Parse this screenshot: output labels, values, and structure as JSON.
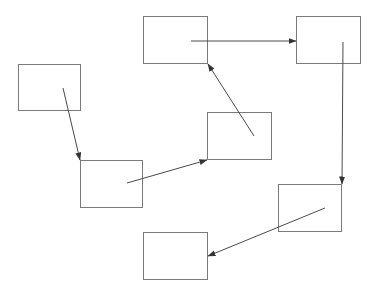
{
  "diagram": {
    "type": "flow",
    "stroke_color": "#7a7a7a",
    "edge_color": "#4a4a4a",
    "background": "#ffffff",
    "nodes": [
      {
        "id": "n1",
        "label": "",
        "x": 18,
        "y": 64,
        "w": 63,
        "h": 47
      },
      {
        "id": "n2",
        "label": "",
        "x": 143,
        "y": 16,
        "w": 65,
        "h": 48
      },
      {
        "id": "n3",
        "label": "",
        "x": 296,
        "y": 16,
        "w": 65,
        "h": 48
      },
      {
        "id": "n4",
        "label": "",
        "x": 207,
        "y": 112,
        "w": 65,
        "h": 48
      },
      {
        "id": "n5",
        "label": "",
        "x": 80,
        "y": 160,
        "w": 63,
        "h": 48
      },
      {
        "id": "n6",
        "label": "",
        "x": 278,
        "y": 184,
        "w": 64,
        "h": 48
      },
      {
        "id": "n7",
        "label": "",
        "x": 143,
        "y": 232,
        "w": 65,
        "h": 48
      }
    ],
    "edges": [
      {
        "from": "n1",
        "to": "n5",
        "x1": 63,
        "y1": 88,
        "x2": 80,
        "y2": 160
      },
      {
        "from": "n5",
        "to": "n4",
        "x1": 127,
        "y1": 183,
        "x2": 207,
        "y2": 160
      },
      {
        "from": "n4",
        "to": "n2",
        "x1": 254,
        "y1": 136,
        "x2": 208,
        "y2": 64
      },
      {
        "from": "n2",
        "to": "n3",
        "x1": 191,
        "y1": 41,
        "x2": 296,
        "y2": 41
      },
      {
        "from": "n3",
        "to": "n6",
        "x1": 343,
        "y1": 42,
        "x2": 342,
        "y2": 184
      },
      {
        "from": "n6",
        "to": "n7",
        "x1": 325,
        "y1": 208,
        "x2": 208,
        "y2": 256
      }
    ]
  }
}
